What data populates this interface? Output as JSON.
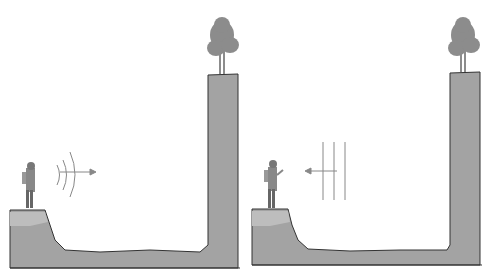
{
  "figure": {
    "panels": [
      {
        "id": "left",
        "wave_direction": "outward",
        "caption": ""
      },
      {
        "id": "right",
        "wave_direction": "returning",
        "caption": ""
      }
    ],
    "colors": {
      "ground": "#9a9a9a",
      "ground_light": "#b5b5b5",
      "outline": "#333333",
      "tree": "#8c8c8c",
      "waves": "#888888",
      "background": "#ffffff"
    }
  }
}
